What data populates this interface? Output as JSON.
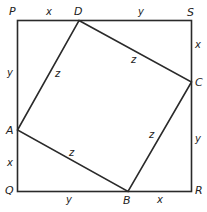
{
  "diagram": {
    "line_color": "#2a2a2a",
    "text_color": "#222222",
    "outer_square": {
      "vertices": [
        "P",
        "Q",
        "R",
        "S"
      ]
    },
    "inner_square": {
      "vertices": [
        "A",
        "B",
        "C",
        "D"
      ]
    },
    "points": {
      "P": "P",
      "Q": "Q",
      "R": "R",
      "S": "S",
      "A": "A",
      "B": "B",
      "C": "C",
      "D": "D"
    },
    "segments": {
      "PD": "x",
      "DS": "y",
      "SC": "x",
      "CR": "y",
      "RB": "x",
      "BQ": "y",
      "QA": "x",
      "AP": "y",
      "AD": "z",
      "DC": "z",
      "CB": "z",
      "BA": "z"
    }
  }
}
